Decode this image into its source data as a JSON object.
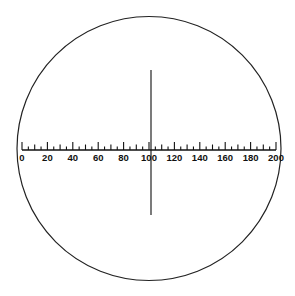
{
  "diagram": {
    "circle": {
      "cx": 149,
      "cy": 148.5,
      "r": 132,
      "stroke": "#222222"
    },
    "scale": {
      "min": 0,
      "max": 200,
      "minor_step": 5,
      "major_step": 20,
      "mid_step": 10,
      "labels": [
        "0",
        "20",
        "40",
        "60",
        "80",
        "100",
        "120",
        "140",
        "160",
        "180",
        "200"
      ],
      "x_start": 22,
      "x_end": 276,
      "baseline_y": 150
    },
    "crosshair": {
      "x": 151,
      "y1": 70,
      "y2": 215
    }
  }
}
